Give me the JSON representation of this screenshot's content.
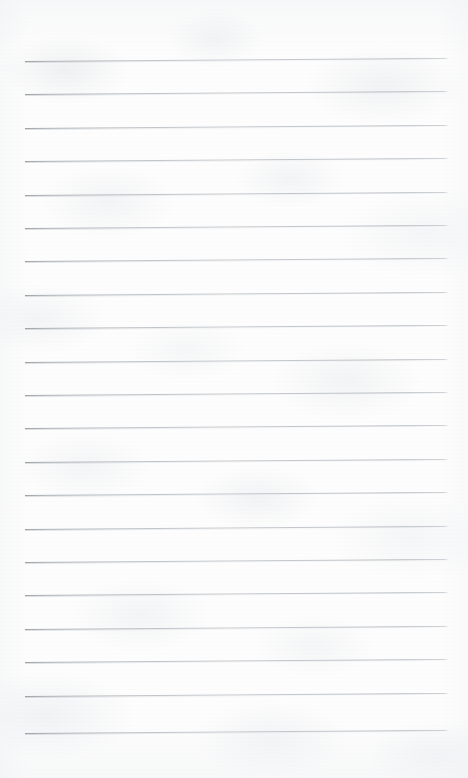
{
  "document": {
    "type": "scanned-ruled-notebook-page",
    "title": "Blank lined page",
    "text_content": "",
    "has_handwriting": false,
    "has_printed_text": false,
    "has_margin_line": false,
    "has_hole_punches": false,
    "has_header": false,
    "has_page_number": false
  },
  "canvas": {
    "width": 468,
    "height": 778
  },
  "colors": {
    "page_background": "#fdfdfd",
    "paper_tint": "#f7f8f9",
    "rule_line": "#b5babd",
    "rule_line_dark_end": "#969ba0",
    "scan_shadow": "#ecedf0"
  },
  "ruling": {
    "line_count": 21,
    "first_line_y": 61,
    "line_spacing": 33.4,
    "line_start_x": 25,
    "line_end_x": 448,
    "line_length": 423,
    "line_thickness": 1,
    "skew_degrees": -0.42,
    "style": "wide-ruled",
    "orientation": "horizontal"
  },
  "lines": [
    {
      "index": 1,
      "y": 61
    },
    {
      "index": 2,
      "y": 94
    },
    {
      "index": 3,
      "y": 128
    },
    {
      "index": 4,
      "y": 161
    },
    {
      "index": 5,
      "y": 195
    },
    {
      "index": 6,
      "y": 228
    },
    {
      "index": 7,
      "y": 261
    },
    {
      "index": 8,
      "y": 295
    },
    {
      "index": 9,
      "y": 328
    },
    {
      "index": 10,
      "y": 362
    },
    {
      "index": 11,
      "y": 395
    },
    {
      "index": 12,
      "y": 428
    },
    {
      "index": 13,
      "y": 462
    },
    {
      "index": 14,
      "y": 495
    },
    {
      "index": 15,
      "y": 529
    },
    {
      "index": 16,
      "y": 562
    },
    {
      "index": 17,
      "y": 595
    },
    {
      "index": 18,
      "y": 629
    },
    {
      "index": 19,
      "y": 662
    },
    {
      "index": 20,
      "y": 696
    },
    {
      "index": 21,
      "y": 733
    }
  ]
}
